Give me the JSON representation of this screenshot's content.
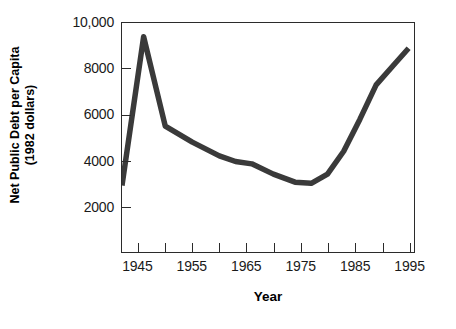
{
  "chart_data": {
    "type": "line",
    "title": "",
    "xlabel": "Year",
    "ylabel": "Net Public Debt per Capita (1982 dollars)",
    "ylabel_lines": [
      "Net Public Debt per Capita",
      "(1982 dollars)"
    ],
    "xlim": [
      1942,
      1996
    ],
    "ylim": [
      0,
      10000
    ],
    "grid": false,
    "legend": false,
    "line_color": "#3a3a3a",
    "axis_color": "#2b2b2b",
    "y_ticks": [
      {
        "value": 10000,
        "label": "10,000"
      },
      {
        "value": 8000,
        "label": "8000"
      },
      {
        "value": 6000,
        "label": "6000"
      },
      {
        "value": 4000,
        "label": "4000"
      },
      {
        "value": 2000,
        "label": "2000"
      }
    ],
    "x_ticks": [
      1945,
      1950,
      1955,
      1960,
      1965,
      1970,
      1975,
      1980,
      1985,
      1990,
      1995
    ],
    "x_tick_labels": [
      {
        "value": 1945,
        "label": "1945"
      },
      {
        "value": 1955,
        "label": "1955"
      },
      {
        "value": 1965,
        "label": "1965"
      },
      {
        "value": 1975,
        "label": "1975"
      },
      {
        "value": 1985,
        "label": "1985"
      },
      {
        "value": 1995,
        "label": "1995"
      }
    ],
    "x": [
      1942,
      1946,
      1950,
      1955,
      1960,
      1963,
      1966,
      1970,
      1974,
      1977,
      1980,
      1983,
      1986,
      1989,
      1992,
      1995
    ],
    "values": [
      2900,
      9400,
      5500,
      4800,
      4200,
      3950,
      3850,
      3400,
      3050,
      3000,
      3400,
      4400,
      5800,
      7300,
      8100,
      8900
    ],
    "series": [
      {
        "name": "Net Public Debt per Capita (1982 dollars)",
        "x": [
          1942,
          1946,
          1950,
          1955,
          1960,
          1963,
          1966,
          1970,
          1974,
          1977,
          1980,
          1983,
          1986,
          1989,
          1992,
          1995
        ],
        "values": [
          2900,
          9400,
          5500,
          4800,
          4200,
          3950,
          3850,
          3400,
          3050,
          3000,
          3400,
          4400,
          5800,
          7300,
          8100,
          8900
        ]
      }
    ]
  }
}
